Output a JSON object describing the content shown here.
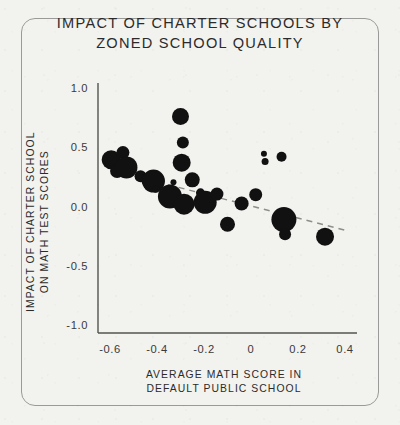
{
  "chart_data": {
    "type": "scatter",
    "title": "IMPACT OF CHARTER SCHOOLS BY ZONED SCHOOL QUALITY",
    "title_lines": [
      "IMPACT OF CHARTER SCHOOLS BY",
      "ZONED SCHOOL QUALITY"
    ],
    "xlabel": "AVERAGE MATH SCORE IN DEFAULT PUBLIC SCHOOL",
    "xlabel_lines": [
      "AVERAGE MATH SCORE IN",
      "DEFAULT PUBLIC SCHOOL"
    ],
    "ylabel": "IMPACT OF CHARTER SCHOOL ON MATH TEST SCORES",
    "ylabel_lines": [
      "IMPACT OF CHARTER SCHOOL",
      "ON MATH TEST SCORES"
    ],
    "xlim": [
      -0.7,
      0.47
    ],
    "ylim": [
      -1.05,
      1.05
    ],
    "xticks": [
      -0.6,
      -0.4,
      -0.2,
      0,
      0.2,
      0.4
    ],
    "xtick_labels": [
      "-0.6",
      "-0.4",
      "-0.2",
      "0",
      "0.2",
      "0.4"
    ],
    "yticks": [
      1.0,
      0.5,
      0.0,
      -0.5,
      -1.0
    ],
    "ytick_labels": [
      "1.0",
      "0.5",
      "0.0",
      "-0.5",
      "-1.0"
    ],
    "grid": false,
    "legend": null,
    "marker_color": "#111111",
    "trendline": {
      "style": "dashed",
      "color": "#8d8d8a",
      "x_start": -0.58,
      "y_start": 0.3,
      "x_end": 0.4,
      "y_end": -0.2
    },
    "size_encoding": "marker area proportional to school enrollment",
    "points": [
      {
        "x": -0.595,
        "y": 0.395,
        "size": 9.5
      },
      {
        "x": -0.57,
        "y": 0.3,
        "size": 7.0
      },
      {
        "x": -0.545,
        "y": 0.455,
        "size": 6.5
      },
      {
        "x": -0.53,
        "y": 0.33,
        "size": 11.0
      },
      {
        "x": -0.47,
        "y": 0.255,
        "size": 6.0
      },
      {
        "x": -0.435,
        "y": 0.225,
        "size": 7.5
      },
      {
        "x": -0.415,
        "y": 0.215,
        "size": 11.5
      },
      {
        "x": -0.405,
        "y": 0.145,
        "size": 3.5
      },
      {
        "x": -0.37,
        "y": 0.11,
        "size": 4.0
      },
      {
        "x": -0.345,
        "y": 0.085,
        "size": 12.0
      },
      {
        "x": -0.33,
        "y": 0.205,
        "size": 3.0
      },
      {
        "x": -0.3,
        "y": 0.76,
        "size": 8.5
      },
      {
        "x": -0.29,
        "y": 0.54,
        "size": 6.0
      },
      {
        "x": -0.295,
        "y": 0.37,
        "size": 9.0
      },
      {
        "x": -0.285,
        "y": 0.02,
        "size": 10.5
      },
      {
        "x": -0.25,
        "y": 0.225,
        "size": 7.5
      },
      {
        "x": -0.215,
        "y": 0.115,
        "size": 4.5
      },
      {
        "x": -0.21,
        "y": 0.06,
        "size": 3.0
      },
      {
        "x": -0.195,
        "y": 0.035,
        "size": 11.5
      },
      {
        "x": -0.145,
        "y": 0.105,
        "size": 6.5
      },
      {
        "x": -0.1,
        "y": -0.15,
        "size": 7.5
      },
      {
        "x": -0.04,
        "y": 0.025,
        "size": 7.0
      },
      {
        "x": 0.02,
        "y": 0.1,
        "size": 6.5
      },
      {
        "x": 0.055,
        "y": 0.445,
        "size": 3.0
      },
      {
        "x": 0.06,
        "y": 0.38,
        "size": 3.5
      },
      {
        "x": 0.13,
        "y": 0.42,
        "size": 5.0
      },
      {
        "x": 0.14,
        "y": -0.11,
        "size": 12.5
      },
      {
        "x": 0.145,
        "y": -0.235,
        "size": 6.0
      },
      {
        "x": 0.315,
        "y": -0.255,
        "size": 9.0
      }
    ]
  }
}
